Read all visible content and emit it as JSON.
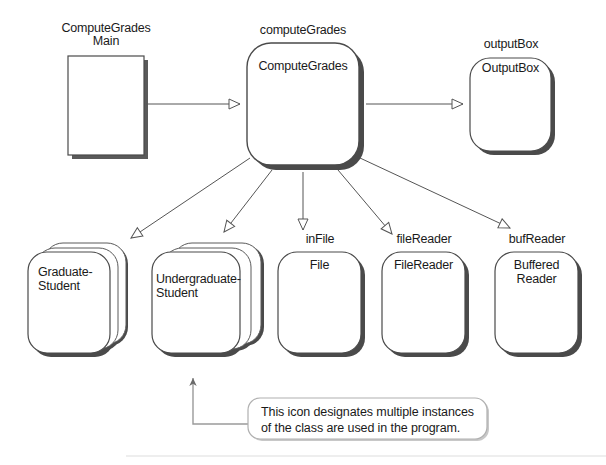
{
  "diagram": {
    "type": "object-diagram",
    "colors": {
      "stroke": "#3a3a3a",
      "shadow": "#4a4a4a",
      "fill": "#ffffff",
      "text": "#1a1a1a"
    },
    "nodes": [
      {
        "id": "computeGradesMain",
        "shape": "rectangle",
        "label_above": "ComputeGrades\nMain",
        "inner_text": "",
        "stacked": false,
        "x": 68,
        "y": 56,
        "w": 76,
        "h": 99
      },
      {
        "id": "computeGrades",
        "shape": "rounded-rectangle",
        "label_above": "computeGrades",
        "inner_text": "ComputeGrades",
        "stacked": false,
        "x": 247,
        "y": 43,
        "w": 112,
        "h": 122
      },
      {
        "id": "outputBox",
        "shape": "rounded-rectangle",
        "label_above": "outputBox",
        "inner_text": "OutputBox",
        "stacked": false,
        "x": 470,
        "y": 58,
        "w": 81,
        "h": 93
      },
      {
        "id": "graduateStudent",
        "shape": "rounded-rectangle",
        "label_above": "",
        "inner_text": "Graduate-\nStudent",
        "stacked": true,
        "x": 28,
        "y": 252,
        "w": 82,
        "h": 101
      },
      {
        "id": "undergraduateStudent",
        "shape": "rounded-rectangle",
        "label_above": "",
        "inner_text": "Undergraduate-\nStudent",
        "stacked": true,
        "x": 152,
        "y": 252,
        "w": 88,
        "h": 101
      },
      {
        "id": "inFile",
        "shape": "rounded-rectangle",
        "label_above": "inFile",
        "inner_text": "File",
        "stacked": false,
        "x": 278,
        "y": 252,
        "w": 83,
        "h": 101
      },
      {
        "id": "fileReader",
        "shape": "rounded-rectangle",
        "label_above": "fileReader",
        "inner_text": "FileReader",
        "stacked": false,
        "x": 382,
        "y": 252,
        "w": 83,
        "h": 101
      },
      {
        "id": "bufReader",
        "shape": "rounded-rectangle",
        "label_above": "bufReader",
        "inner_text": "Buffered\nReader",
        "stacked": false,
        "x": 495,
        "y": 252,
        "w": 83,
        "h": 101
      }
    ],
    "edges": [
      {
        "from": "computeGradesMain",
        "to": "computeGrades",
        "arrowhead": "hollow-triangle"
      },
      {
        "from": "computeGrades",
        "to": "outputBox",
        "arrowhead": "hollow-triangle"
      },
      {
        "from": "computeGrades",
        "to": "graduateStudent",
        "arrowhead": "hollow-triangle"
      },
      {
        "from": "computeGrades",
        "to": "undergraduateStudent",
        "arrowhead": "hollow-triangle"
      },
      {
        "from": "computeGrades",
        "to": "inFile",
        "arrowhead": "hollow-triangle"
      },
      {
        "from": "computeGrades",
        "to": "fileReader",
        "arrowhead": "hollow-triangle"
      },
      {
        "from": "computeGrades",
        "to": "bufReader",
        "arrowhead": "hollow-triangle"
      }
    ],
    "note": {
      "line1": "This icon designates multiple instances",
      "line2": "of the class are used in the program.",
      "x": 248,
      "y": 398,
      "w": 239,
      "h": 41,
      "points_to": "undergraduateStudent"
    }
  },
  "labels": {
    "computeGradesMain_above": "ComputeGrades\nMain",
    "computeGrades_above": "computeGrades",
    "computeGrades_inner": "ComputeGrades",
    "outputBox_above": "outputBox",
    "outputBox_inner": "OutputBox",
    "graduateStudent_inner": "Graduate-\nStudent",
    "undergraduateStudent_inner": "Undergraduate-\nStudent",
    "inFile_above": "inFile",
    "inFile_inner": "File",
    "fileReader_above": "fileReader",
    "fileReader_inner": "FileReader",
    "bufReader_above": "bufReader",
    "bufReader_inner": "Buffered\nReader",
    "note_line1": "This icon designates multiple instances",
    "note_line2": "of the class are used in the program."
  }
}
